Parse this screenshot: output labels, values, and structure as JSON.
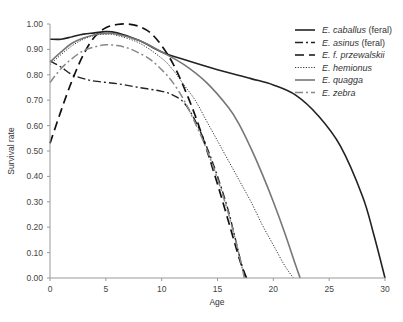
{
  "chart_data": {
    "type": "line",
    "title": "",
    "xlabel": "Age",
    "ylabel": "Survival rate",
    "xlim": [
      0,
      30
    ],
    "ylim": [
      0,
      1
    ],
    "xticks": [
      0,
      5,
      10,
      15,
      20,
      25,
      30
    ],
    "yticks": [
      "0.00",
      "0.10",
      "0.20",
      "0.30",
      "0.40",
      "0.50",
      "0.60",
      "0.70",
      "0.80",
      "0.90",
      "1.00"
    ],
    "grid": false,
    "legend_position": "top-right",
    "series": [
      {
        "name": "E. caballus",
        "suffix": " (feral)",
        "color": "#222222",
        "width": 1.6,
        "dash": "",
        "x": [
          0,
          1,
          2,
          3,
          4,
          5,
          6,
          8,
          10,
          12,
          15,
          18,
          20,
          22,
          24,
          26,
          28,
          29,
          30
        ],
        "y": [
          0.94,
          0.94,
          0.95,
          0.96,
          0.965,
          0.97,
          0.965,
          0.935,
          0.89,
          0.86,
          0.82,
          0.785,
          0.76,
          0.72,
          0.64,
          0.52,
          0.32,
          0.17,
          0.0
        ]
      },
      {
        "name": "E. asinus",
        "suffix": " (feral)",
        "color": "#222222",
        "width": 1.4,
        "dash": "8,3,2,3",
        "x": [
          0,
          1,
          2,
          3,
          4,
          6,
          8,
          10,
          11,
          12,
          13,
          14,
          15,
          16,
          17,
          17.5
        ],
        "y": [
          0.855,
          0.83,
          0.8,
          0.785,
          0.775,
          0.765,
          0.75,
          0.735,
          0.72,
          0.69,
          0.62,
          0.52,
          0.4,
          0.26,
          0.08,
          0.0
        ]
      },
      {
        "name": "E. f. przewalskii",
        "suffix": "",
        "color": "#111111",
        "width": 1.7,
        "dash": "9,5",
        "x": [
          0,
          1,
          2,
          3,
          4,
          5,
          6,
          7,
          8,
          9,
          10,
          11,
          12,
          13,
          14,
          15,
          16,
          17,
          17.6
        ],
        "y": [
          0.53,
          0.66,
          0.78,
          0.88,
          0.95,
          0.985,
          0.998,
          1.0,
          0.99,
          0.965,
          0.915,
          0.845,
          0.75,
          0.64,
          0.51,
          0.37,
          0.22,
          0.07,
          0.0
        ]
      },
      {
        "name": "E. hemionus",
        "suffix": "",
        "color": "#333333",
        "width": 1.0,
        "dash": "1.2,1.5",
        "x": [
          0,
          1,
          2,
          3,
          4,
          5,
          6,
          8,
          10,
          11,
          12,
          13,
          14,
          15,
          16,
          17,
          18,
          19,
          20,
          21,
          21.8
        ],
        "y": [
          0.84,
          0.88,
          0.915,
          0.94,
          0.955,
          0.96,
          0.955,
          0.925,
          0.865,
          0.82,
          0.76,
          0.7,
          0.62,
          0.54,
          0.46,
          0.38,
          0.3,
          0.21,
          0.13,
          0.05,
          0.0
        ]
      },
      {
        "name": "E. quagga",
        "suffix": "",
        "color": "#777777",
        "width": 1.6,
        "dash": "",
        "x": [
          0,
          1,
          2,
          3,
          4,
          5,
          6,
          8,
          10,
          12,
          14,
          16,
          17,
          18,
          19,
          20,
          21,
          22,
          22.4
        ],
        "y": [
          0.85,
          0.89,
          0.925,
          0.945,
          0.958,
          0.963,
          0.96,
          0.935,
          0.89,
          0.84,
          0.77,
          0.67,
          0.6,
          0.51,
          0.41,
          0.3,
          0.18,
          0.05,
          0.0
        ]
      },
      {
        "name": "E. zebra",
        "suffix": "",
        "color": "#888888",
        "width": 1.5,
        "dash": "8,3,2,3",
        "x": [
          0,
          1,
          2,
          3,
          4,
          5,
          6,
          7,
          8,
          9,
          10,
          11,
          12,
          13,
          14,
          15,
          16,
          17,
          17.4
        ],
        "y": [
          0.77,
          0.825,
          0.865,
          0.895,
          0.91,
          0.918,
          0.915,
          0.905,
          0.885,
          0.86,
          0.82,
          0.77,
          0.7,
          0.61,
          0.51,
          0.39,
          0.25,
          0.08,
          0.0
        ]
      }
    ]
  },
  "legend": {
    "items": [
      {
        "name": "E. caballus",
        "suffix": " (feral)"
      },
      {
        "name": "E. asinus",
        "suffix": " (feral)"
      },
      {
        "name": "E. f. przewalskii",
        "suffix": ""
      },
      {
        "name": "E. hemionus",
        "suffix": ""
      },
      {
        "name": "E. quagga",
        "suffix": ""
      },
      {
        "name": "E. zebra",
        "suffix": ""
      }
    ]
  }
}
